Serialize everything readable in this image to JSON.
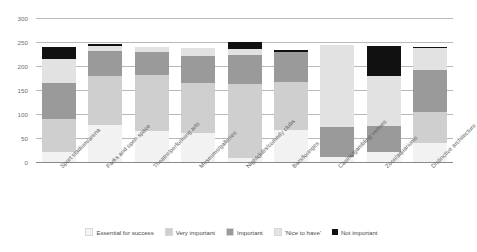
{
  "chart_data": {
    "type": "bar",
    "subtype": "stacked-vertical",
    "title": "",
    "xlabel": "",
    "ylabel": "",
    "ylim": [
      0,
      300
    ],
    "yticks": [
      0,
      50,
      100,
      150,
      200,
      250,
      300
    ],
    "grid": true,
    "legend_position": "bottom",
    "categories": [
      "Sport stadium/arena",
      "Parks and open space",
      "Theatre/performing arts",
      "Museums/galleries",
      "Nightclubs/comedy clubs",
      "Bars/lounges",
      "Casino/gambling venues",
      "Zoos/aquariums",
      "Distinctive architecture"
    ],
    "series": [
      {
        "name": "Essential for success",
        "color": "#f2f2f2",
        "values": [
          20,
          78,
          65,
          60,
          8,
          66,
          10,
          20,
          40
        ]
      },
      {
        "name": "Very important",
        "color": "#cfcfcf",
        "values": [
          70,
          102,
          117,
          105,
          155,
          100,
          0,
          0,
          65
        ]
      },
      {
        "name": "Important",
        "color": "#9a9a9a",
        "values": [
          75,
          52,
          48,
          55,
          59,
          63,
          62,
          55,
          87
        ]
      },
      {
        "name": "'Nice to have'",
        "color": "#e2e2e2",
        "values": [
          50,
          10,
          10,
          18,
          13,
          1,
          171,
          105,
          45
        ]
      },
      {
        "name": "Not important",
        "color": "#111111",
        "values": [
          25,
          3,
          0,
          0,
          15,
          4,
          0,
          62,
          3
        ]
      }
    ],
    "totals": [
      240,
      245,
      240,
      238,
      250,
      234,
      243,
      242,
      240
    ]
  },
  "legend": {
    "items": [
      {
        "label": "Essential for success",
        "color": "#f2f2f2"
      },
      {
        "label": "Very important",
        "color": "#cfcfcf"
      },
      {
        "label": "Important",
        "color": "#9a9a9a"
      },
      {
        "label": "'Nice to have'",
        "color": "#e2e2e2"
      },
      {
        "label": "Not important",
        "color": "#111111"
      }
    ]
  }
}
